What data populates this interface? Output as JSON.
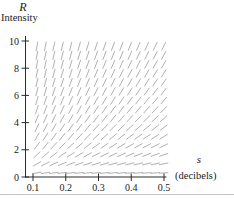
{
  "figure": {
    "background": "#ffffff",
    "text_color": "#1b1b1b",
    "axis_color": "#2b2b2b",
    "segment_color": "#9c9c9c",
    "edge_line_color": "#c6c6c6"
  },
  "y_axis": {
    "symbol": "R",
    "title": "Intensity",
    "tick_labels": [
      "0",
      "2",
      "4",
      "6",
      "8",
      "10"
    ],
    "tick_values": [
      0,
      2,
      4,
      6,
      8,
      10
    ],
    "range": [
      0,
      10
    ]
  },
  "x_axis": {
    "symbol": "s",
    "unit_label": "(decibels)",
    "tick_labels": [
      "0.1",
      "0.2",
      "0.3",
      "0.4",
      "0.5"
    ],
    "tick_values": [
      0.1,
      0.2,
      0.3,
      0.4,
      0.5
    ],
    "range": [
      0.1,
      0.5
    ]
  },
  "chart_data": {
    "type": "slope_field",
    "title": "",
    "x_variable": "s",
    "y_variable": "R",
    "xlabel": "s (decibels)",
    "ylabel": "R Intensity",
    "x_range": [
      0.1,
      0.5
    ],
    "y_range": [
      0,
      10
    ],
    "grid_on": false,
    "legend": null,
    "slope_model": "dR/ds = k*R/(1+10*s), slopes steep at upper left, near horizontal as R approaches 0",
    "model_k": 30,
    "grid": {
      "s_start": 0.112,
      "s_step": 0.0258,
      "s_count": 16,
      "R_start": 0.3,
      "R_step": 0.665,
      "R_count": 15
    },
    "segment_length_px": 8.6
  }
}
